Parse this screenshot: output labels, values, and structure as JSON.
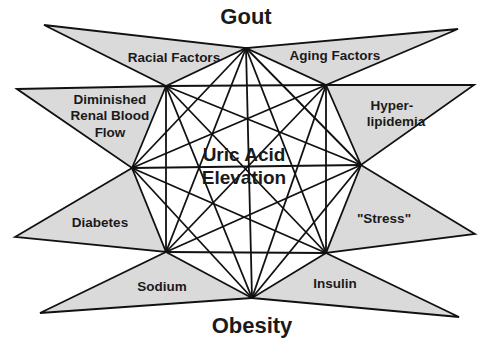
{
  "diagram": {
    "title_top": "Gout",
    "title_bottom": "Obesity",
    "center": {
      "line1": "Uric Acid",
      "line2": "Elevation"
    },
    "colors": {
      "fill": "#dadada",
      "stroke": "#111111",
      "background": "#ffffff"
    },
    "vertices": {
      "top": [
        246,
        48
      ],
      "upper_left": [
        166,
        86
      ],
      "upper_right": [
        326,
        85
      ],
      "left": [
        132,
        168
      ],
      "right": [
        361,
        165
      ],
      "lower_left": [
        166,
        252
      ],
      "lower_right": [
        326,
        253
      ],
      "bottom": [
        252,
        298
      ]
    },
    "factors": [
      {
        "id": "racial",
        "lines": [
          "Racial Factors"
        ]
      },
      {
        "id": "aging",
        "lines": [
          "Aging Factors"
        ]
      },
      {
        "id": "renal",
        "lines": [
          "Diminished",
          "Renal Blood",
          "Flow"
        ]
      },
      {
        "id": "hyperlipidemia",
        "lines": [
          "Hyper-",
          "lipidemia"
        ]
      },
      {
        "id": "diabetes",
        "lines": [
          "Diabetes"
        ]
      },
      {
        "id": "stress",
        "lines": [
          "\"Stress\""
        ]
      },
      {
        "id": "sodium",
        "lines": [
          "Sodium"
        ]
      },
      {
        "id": "insulin",
        "lines": [
          "Insulin"
        ]
      }
    ]
  }
}
